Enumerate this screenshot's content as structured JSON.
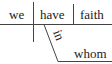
{
  "diagram": {
    "type": "sentence-diagram",
    "subject": "we",
    "verb": "have",
    "object": "faith",
    "preposition": "in",
    "prepositional_object": "whom",
    "line_color": "#444444",
    "text_color": "#222222"
  }
}
